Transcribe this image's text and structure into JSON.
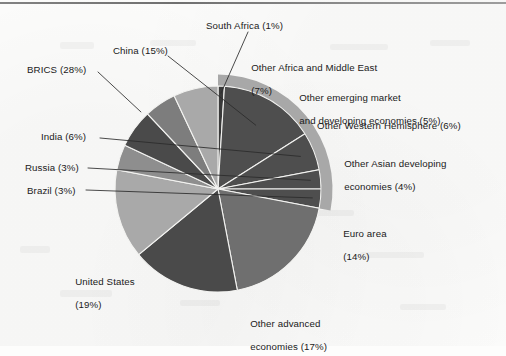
{
  "figure": {
    "background_color": "#fcfcfb",
    "has_top_rule": true
  },
  "chart_data": {
    "type": "pie",
    "title": "",
    "subtitle": "",
    "xlabel": "",
    "ylabel": "",
    "legend_position": "callout-labels",
    "grid": false,
    "units": "percent of world GDP",
    "start_angle_deg": 90,
    "direction": "counterclockwise",
    "center_px": [
      218,
      189
    ],
    "radius_px": 103,
    "categories": [
      "South Africa",
      "China",
      "India",
      "Russia",
      "Brazil",
      "United States",
      "Other advanced economies",
      "Euro area",
      "Other Asian developing economies",
      "Other Western Hemisphere",
      "Other emerging market and developing economies",
      "Other Africa and Middle East"
    ],
    "values": [
      1,
      15,
      6,
      3,
      3,
      19,
      17,
      14,
      4,
      6,
      5,
      7
    ],
    "colors": [
      "#3a3a3a",
      "#4e4e4e",
      "#4e4e4e",
      "#4e4e4e",
      "#4e4e4e",
      "#6f6f6f",
      "#4a4a4a",
      "#a9a9a9",
      "#8e8e8e",
      "#4a4a4a",
      "#7d7d7d",
      "#a9a9a9"
    ],
    "groups": [
      {
        "name": "BRICS",
        "value": 28,
        "members": [
          "Brazil",
          "Russia",
          "India",
          "China",
          "South Africa"
        ],
        "ring_color": "#a8a8a8"
      }
    ]
  },
  "labels": {
    "south_africa": "South Africa (1%)",
    "china": "China (15%)",
    "brics": "BRICS (28%)",
    "india": "India (6%)",
    "russia": "Russia (3%)",
    "brazil": "Brazil (3%)",
    "united_states_l1": "United States",
    "united_states_l2": "(19%)",
    "other_advanced_l1": "Other advanced",
    "other_advanced_l2": "economies (17%)",
    "euro_area_l1": "Euro area",
    "euro_area_l2": "(14%)",
    "other_asian_l1": "Other Asian developing",
    "other_asian_l2": "economies (4%)",
    "other_western": "Other Western Hemisphere (6%)",
    "other_emerging_l1": "Other emerging market",
    "other_emerging_l2": "and developing economies (5%)",
    "other_africa_l1": "Other Africa and Middle East",
    "other_africa_l2": "(7%)"
  }
}
